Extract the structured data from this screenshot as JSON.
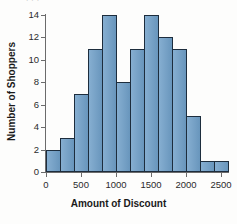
{
  "figure": {
    "background_color": "#fdfdfc",
    "bar_fill_color": "#6f9fc8",
    "bar_edge_color": "#1d2d3d",
    "axis_color": "#6b6b6b",
    "top_cropped_text": "|||",
    "x_axis_title": "Amount of Discount",
    "y_axis_title": "Number of Shoppers"
  },
  "chart_data": {
    "type": "bar",
    "title": "",
    "xlabel": "Amount of Discount",
    "ylabel": "Number of Shoppers",
    "xlim": [
      0,
      2600
    ],
    "ylim": [
      0,
      14
    ],
    "bin_width": 200,
    "grid": false,
    "legend": "none",
    "xticks": [
      0,
      500,
      1000,
      1500,
      2000,
      2500
    ],
    "xtick_labels": [
      "0",
      "500",
      "1000",
      "1500",
      "2000",
      "2500"
    ],
    "yticks": [
      0,
      2,
      4,
      6,
      8,
      10,
      12,
      14
    ],
    "ytick_labels": [
      "0",
      "2",
      "4",
      "6",
      "8",
      "10",
      "12",
      "14"
    ],
    "bin_edges": [
      0,
      200,
      400,
      600,
      800,
      1000,
      1200,
      1400,
      1600,
      1800,
      2000,
      2200,
      2400,
      2600
    ],
    "categories": [
      "0-200",
      "200-400",
      "400-600",
      "600-800",
      "800-1000",
      "1000-1200",
      "1200-1400",
      "1400-1600",
      "1600-1800",
      "1800-2000",
      "2000-2200",
      "2200-2400",
      "2400-2600"
    ],
    "values": [
      2,
      3,
      7,
      11,
      14,
      8,
      11,
      14,
      12,
      11,
      5,
      1,
      1
    ]
  }
}
